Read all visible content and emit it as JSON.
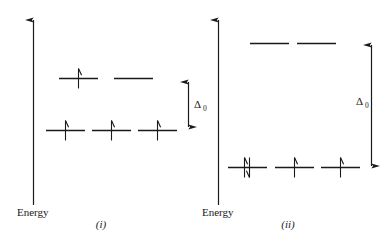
{
  "figure": {
    "type": "crystal-field-splitting-diagram",
    "background_color": "#ffffff",
    "stroke_color": "#1a1a1a",
    "panels": [
      {
        "id": "panel-i",
        "caption": "(i)",
        "axis_label": "Energy",
        "splitting_label": "Δ",
        "splitting_subscript": "0",
        "levels": [
          {
            "name": "upper-level",
            "orbitals": [
              {
                "electrons": [
                  "up"
                ]
              },
              {
                "electrons": []
              }
            ]
          },
          {
            "name": "lower-level",
            "orbitals": [
              {
                "electrons": [
                  "up"
                ]
              },
              {
                "electrons": [
                  "up"
                ]
              },
              {
                "electrons": [
                  "up"
                ]
              }
            ]
          }
        ]
      },
      {
        "id": "panel-ii",
        "caption": "(ii)",
        "axis_label": "Energy",
        "splitting_label": "Δ",
        "splitting_subscript": "0",
        "levels": [
          {
            "name": "upper-level",
            "orbitals": [
              {
                "electrons": []
              },
              {
                "electrons": []
              }
            ]
          },
          {
            "name": "lower-level",
            "orbitals": [
              {
                "electrons": [
                  "up",
                  "down"
                ]
              },
              {
                "electrons": [
                  "up"
                ]
              },
              {
                "electrons": [
                  "up"
                ]
              }
            ]
          }
        ]
      }
    ]
  }
}
